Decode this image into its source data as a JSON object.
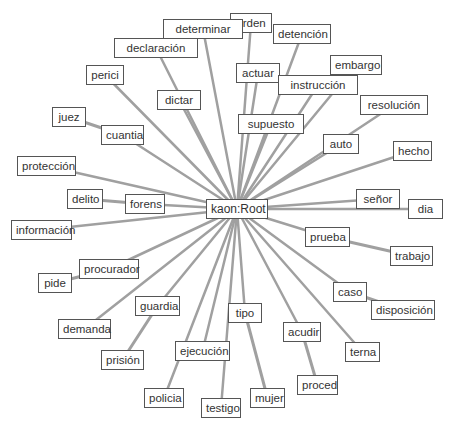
{
  "diagram": {
    "type": "radial-graph",
    "edge_color": "#a0a0a0",
    "node_border_color": "#555555",
    "root": {
      "id": "root",
      "label": "kaon:Root",
      "x": 206,
      "y": 199,
      "w": 62
    },
    "nodes": [
      {
        "id": "orden",
        "label": "orden",
        "x": 230,
        "y": 13,
        "w": 42,
        "parent": "root"
      },
      {
        "id": "determinar",
        "label": "determinar",
        "x": 163,
        "y": 19,
        "w": 80,
        "parent": "root"
      },
      {
        "id": "detencion",
        "label": "detención",
        "x": 273,
        "y": 24,
        "w": 58,
        "parent": "root"
      },
      {
        "id": "declaracion",
        "label": "declaración",
        "x": 114,
        "y": 38,
        "w": 84,
        "parent": "root"
      },
      {
        "id": "actuar",
        "label": "actuar",
        "x": 236,
        "y": 63,
        "w": 44,
        "parent": "root"
      },
      {
        "id": "embargo",
        "label": "embargo",
        "x": 330,
        "y": 55,
        "w": 52,
        "parent": "root"
      },
      {
        "id": "instruccion",
        "label": "instrucción",
        "x": 278,
        "y": 75,
        "w": 80,
        "parent": "root"
      },
      {
        "id": "perici",
        "label": "perici",
        "x": 86,
        "y": 65,
        "w": 38,
        "parent": "root"
      },
      {
        "id": "resolucion",
        "label": "resolución",
        "x": 360,
        "y": 95,
        "w": 68,
        "parent": "root"
      },
      {
        "id": "dictar",
        "label": "dictar",
        "x": 157,
        "y": 90,
        "w": 44,
        "parent": "root"
      },
      {
        "id": "juez",
        "label": "juez",
        "x": 52,
        "y": 107,
        "w": 34,
        "parent": "cuantia"
      },
      {
        "id": "supuesto",
        "label": "supuesto",
        "x": 238,
        "y": 114,
        "w": 66,
        "parent": "root"
      },
      {
        "id": "cuantia",
        "label": "cuantia",
        "x": 101,
        "y": 125,
        "w": 43,
        "parent": "root"
      },
      {
        "id": "auto",
        "label": "auto",
        "x": 323,
        "y": 134,
        "w": 36,
        "parent": "root"
      },
      {
        "id": "hecho",
        "label": "hecho",
        "x": 393,
        "y": 141,
        "w": 39,
        "parent": "root"
      },
      {
        "id": "proteccion",
        "label": "protección",
        "x": 17,
        "y": 156,
        "w": 59,
        "parent": "root"
      },
      {
        "id": "senor",
        "label": "señor",
        "x": 356,
        "y": 189,
        "w": 44,
        "parent": "root"
      },
      {
        "id": "delito",
        "label": "delito",
        "x": 67,
        "y": 189,
        "w": 36,
        "parent": "forens"
      },
      {
        "id": "forens",
        "label": "forens",
        "x": 125,
        "y": 194,
        "w": 40,
        "parent": "root"
      },
      {
        "id": "dia",
        "label": "dia",
        "x": 408,
        "y": 199,
        "w": 35,
        "parent": "root"
      },
      {
        "id": "informacion",
        "label": "información",
        "x": 11,
        "y": 220,
        "w": 61,
        "parent": "root"
      },
      {
        "id": "prueba",
        "label": "prueba",
        "x": 305,
        "y": 227,
        "w": 45,
        "parent": "root"
      },
      {
        "id": "trabajo",
        "label": "trabajo",
        "x": 390,
        "y": 246,
        "w": 43,
        "parent": "prueba"
      },
      {
        "id": "procurador",
        "label": "procurador",
        "x": 79,
        "y": 259,
        "w": 60,
        "parent": "root"
      },
      {
        "id": "pide",
        "label": "pide",
        "x": 38,
        "y": 273,
        "w": 34,
        "parent": "procurador"
      },
      {
        "id": "caso",
        "label": "caso",
        "x": 333,
        "y": 282,
        "w": 34,
        "parent": "root"
      },
      {
        "id": "guardia",
        "label": "guardia",
        "x": 135,
        "y": 296,
        "w": 45,
        "parent": "root"
      },
      {
        "id": "disposicion",
        "label": "disposición",
        "x": 371,
        "y": 300,
        "w": 64,
        "parent": "caso"
      },
      {
        "id": "tipo",
        "label": "tipo",
        "x": 228,
        "y": 303,
        "w": 34,
        "parent": "root"
      },
      {
        "id": "demanda",
        "label": "demanda",
        "x": 58,
        "y": 319,
        "w": 53,
        "parent": "root"
      },
      {
        "id": "acudir",
        "label": "acudir",
        "x": 283,
        "y": 322,
        "w": 38,
        "parent": "root"
      },
      {
        "id": "ejecucion",
        "label": "ejecución",
        "x": 175,
        "y": 341,
        "w": 55,
        "parent": "root"
      },
      {
        "id": "terna",
        "label": "terna",
        "x": 345,
        "y": 342,
        "w": 35,
        "parent": "root"
      },
      {
        "id": "prision",
        "label": "prisión",
        "x": 101,
        "y": 350,
        "w": 43,
        "parent": "guardia"
      },
      {
        "id": "policia",
        "label": "policia",
        "x": 144,
        "y": 388,
        "w": 40,
        "parent": "root"
      },
      {
        "id": "proced",
        "label": "proced",
        "x": 297,
        "y": 375,
        "w": 41,
        "parent": "acudir"
      },
      {
        "id": "mujer",
        "label": "mujer",
        "x": 250,
        "y": 388,
        "w": 35,
        "parent": "tipo"
      },
      {
        "id": "testigo",
        "label": "testigo",
        "x": 201,
        "y": 398,
        "w": 40,
        "parent": "root"
      }
    ]
  }
}
